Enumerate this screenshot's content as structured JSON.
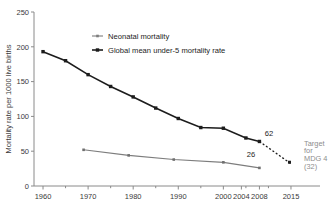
{
  "chart_data": {
    "type": "line",
    "title": "",
    "xlabel": "",
    "ylabel": "Mortality rate per 1000 live births",
    "xlim": [
      1958,
      2017
    ],
    "ylim": [
      0,
      250
    ],
    "grid": false,
    "legend_position": "top-center",
    "y_ticks": [
      "0",
      "50",
      "100",
      "150",
      "200",
      "250"
    ],
    "y_tick_values": [
      0,
      50,
      100,
      150,
      200,
      250
    ],
    "x_ticks": [
      "1960",
      "1970",
      "1980",
      "1990",
      "2000",
      "2004",
      "2008",
      "2015"
    ],
    "x_tick_values": [
      1960,
      1970,
      1980,
      1990,
      2000,
      2004,
      2008,
      2015
    ],
    "x_minor_ticks": [
      1965,
      1975,
      1985,
      1995,
      2005,
      2010
    ],
    "series": [
      {
        "name": "Global mean under-5 mortality rate",
        "color": "#1c1c1c",
        "marker": "square",
        "x": [
          1960,
          1965,
          1970,
          1975,
          1980,
          1985,
          1990,
          1995,
          2000,
          2005,
          2008
        ],
        "values": [
          193,
          180,
          160,
          143,
          128,
          112,
          97,
          84,
          83,
          69,
          64
        ]
      },
      {
        "name": "Neonatal mortality",
        "color": "#7d7d7d",
        "marker": "square",
        "x": [
          1969,
          1979,
          1989,
          2000,
          2008
        ],
        "values": [
          52,
          44,
          38,
          34,
          26
        ]
      },
      {
        "name": "Projection to MDG 4 target",
        "color": "#1c1c1c",
        "style": "dashed",
        "x": [
          2008,
          2015
        ],
        "values": [
          64,
          32
        ]
      }
    ],
    "annotations": [
      {
        "label": "62",
        "x": 2009,
        "y": 72
      },
      {
        "label": "26",
        "x": 2006,
        "y": 40
      },
      {
        "label": "Target",
        "x": 2016,
        "y": 56
      },
      {
        "label": "for",
        "x": 2016,
        "y": 45
      },
      {
        "label": "MDG 4",
        "x": 2016,
        "y": 34
      },
      {
        "label": "(32)",
        "x": 2016,
        "y": 23
      }
    ]
  },
  "legend": {
    "items": [
      {
        "label": "Neonatal mortality",
        "color": "#7d7d7d"
      },
      {
        "label": "Global mean under-5 mortality rate",
        "color": "#1c1c1c"
      }
    ]
  },
  "target_note": {
    "line1": "Target",
    "line2": "for",
    "line3": "MDG 4",
    "line4": "(32)"
  },
  "point_labels": {
    "u5mr_2008": "62",
    "neonatal_2008": "26"
  }
}
